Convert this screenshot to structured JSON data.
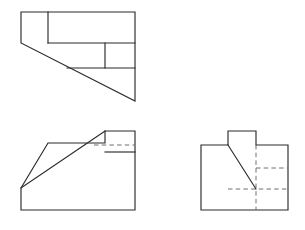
{
  "document": {
    "title": "Orthographic Projection — Three View Drawing",
    "background_color": "#ffffff",
    "visible_line_color": "#2b2b2b",
    "hidden_line_color": "#6f6f6f",
    "canvas_width": 305,
    "canvas_height": 230
  },
  "views": {
    "top": {
      "name": "top-view",
      "label": "Top View",
      "outline_points": "21,12 135,12 135,101 21,43",
      "interior_lines": [
        {
          "name": "inner-rect-left-edge",
          "points": "48,12 48,43"
        },
        {
          "name": "inner-rect-bottom-edge",
          "points": "48,43 135,43"
        },
        {
          "name": "middle-band-bottom-edge",
          "points": "67,68 135,68"
        },
        {
          "name": "middle-band-left-edge",
          "points": "105,43 105,68"
        }
      ],
      "hidden_lines": []
    },
    "front": {
      "name": "front-view",
      "label": "Front View",
      "outline_points": "21,188 48,143 105,143 105,131 135,131 135,210 21,210",
      "interior_lines": [
        {
          "name": "chamfer-diagonal",
          "points": "21,188 105,131"
        },
        {
          "name": "upper-right-horizontal",
          "points": "105,152 135,152"
        }
      ],
      "hidden_lines": [
        {
          "name": "hidden-upper-horizontal",
          "points": "94,145 135,145"
        }
      ]
    },
    "side": {
      "name": "side-view",
      "label": "Right Side View",
      "outline_points": "201,145 228,145 228,131 256,131 256,145 288,145 288,210 201,210",
      "interior_lines": [
        {
          "name": "chamfer-diagonal",
          "points": "228,145 256,189"
        }
      ],
      "hidden_lines": [
        {
          "name": "hidden-vertical-right",
          "points": "256,145 256,210"
        },
        {
          "name": "hidden-horizontal-upper",
          "points": "256,168 288,168"
        },
        {
          "name": "hidden-horizontal-lower",
          "points": "228,189 288,189"
        }
      ]
    }
  }
}
